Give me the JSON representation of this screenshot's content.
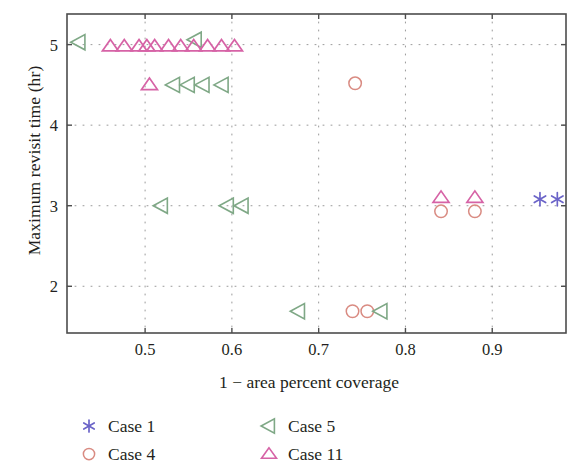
{
  "chart_data": {
    "type": "scatter",
    "title": "",
    "xlabel": "1 − area percent coverage",
    "ylabel": "Maximum revisit time (hr)",
    "xlim": [
      0.41,
      0.985
    ],
    "ylim": [
      1.42,
      5.38
    ],
    "xticks": [
      0.5,
      0.6,
      0.7,
      0.8,
      0.9
    ],
    "xticklabels": [
      "0.5",
      "0.6",
      "0.7",
      "0.8",
      "0.9"
    ],
    "yticks": [
      2,
      3,
      4,
      5
    ],
    "yticklabels": [
      "2",
      "3",
      "4",
      "5"
    ],
    "grid": "dotted",
    "legend_position": "below-axes",
    "series": [
      {
        "name": "Case 1",
        "marker": "star",
        "color": "#6b64c8",
        "points": [
          {
            "x": 0.955,
            "y": 3.08
          },
          {
            "x": 0.975,
            "y": 3.08
          }
        ]
      },
      {
        "name": "Case 4",
        "marker": "circle",
        "color": "#d98b82",
        "points": [
          {
            "x": 0.742,
            "y": 4.52
          },
          {
            "x": 0.739,
            "y": 1.69
          },
          {
            "x": 0.756,
            "y": 1.69
          },
          {
            "x": 0.841,
            "y": 2.93
          },
          {
            "x": 0.88,
            "y": 2.93
          }
        ]
      },
      {
        "name": "Case 5",
        "marker": "triangle-left",
        "color": "#7fa886",
        "points": [
          {
            "x": 0.424,
            "y": 5.03
          },
          {
            "x": 0.533,
            "y": 4.5
          },
          {
            "x": 0.55,
            "y": 4.5
          },
          {
            "x": 0.567,
            "y": 4.5
          },
          {
            "x": 0.589,
            "y": 4.5
          },
          {
            "x": 0.519,
            "y": 3.0
          },
          {
            "x": 0.595,
            "y": 3.0
          },
          {
            "x": 0.612,
            "y": 3.0
          },
          {
            "x": 0.677,
            "y": 1.69
          },
          {
            "x": 0.772,
            "y": 1.69
          },
          {
            "x": 0.558,
            "y": 5.06
          }
        ]
      },
      {
        "name": "Case 11",
        "marker": "triangle-up",
        "color": "#d663a6",
        "points": [
          {
            "x": 0.46,
            "y": 4.98
          },
          {
            "x": 0.476,
            "y": 4.98
          },
          {
            "x": 0.493,
            "y": 4.98
          },
          {
            "x": 0.502,
            "y": 4.98
          },
          {
            "x": 0.511,
            "y": 4.98
          },
          {
            "x": 0.527,
            "y": 4.98
          },
          {
            "x": 0.541,
            "y": 4.98
          },
          {
            "x": 0.556,
            "y": 4.98
          },
          {
            "x": 0.572,
            "y": 4.98
          },
          {
            "x": 0.588,
            "y": 4.98
          },
          {
            "x": 0.603,
            "y": 4.98
          },
          {
            "x": 0.505,
            "y": 4.5
          },
          {
            "x": 0.841,
            "y": 3.1
          },
          {
            "x": 0.88,
            "y": 3.1
          }
        ]
      }
    ]
  },
  "axis": {
    "ylabel": "Maximum revisit time (hr)",
    "xlabel": "1 − area percent coverage",
    "xtick_0": "0.5",
    "xtick_1": "0.6",
    "xtick_2": "0.7",
    "xtick_3": "0.8",
    "xtick_4": "0.9",
    "ytick_0": "2",
    "ytick_1": "3",
    "ytick_2": "4",
    "ytick_3": "5"
  },
  "legend": {
    "entries": [
      {
        "label": "Case 1",
        "marker": "star",
        "color": "#6b64c8"
      },
      {
        "label": "Case 5",
        "marker": "triangle-left",
        "color": "#7fa886"
      },
      {
        "label": "Case 4",
        "marker": "circle",
        "color": "#d98b82"
      },
      {
        "label": "Case 11",
        "marker": "triangle-up",
        "color": "#d663a6"
      }
    ]
  },
  "colors": {
    "case1": "#6b64c8",
    "case4": "#d98b82",
    "case5": "#7fa886",
    "case11": "#d663a6",
    "axis": "#4d4d4d",
    "grid": "#9a9a9a",
    "text": "#231f20"
  }
}
